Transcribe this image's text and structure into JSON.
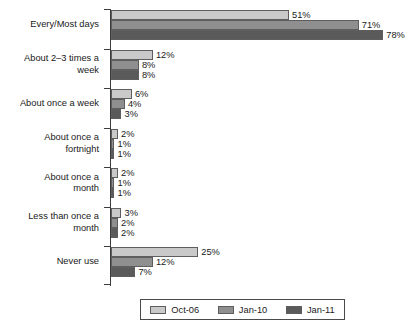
{
  "chart_data": {
    "type": "bar",
    "orientation": "horizontal",
    "title": "",
    "subtitle": "",
    "xlabel": "",
    "ylabel": "",
    "xlim": [
      0,
      80
    ],
    "grid": false,
    "legend_position": "bottom-center",
    "value_label_suffix": "%",
    "categories": [
      "Every/Most days",
      "About 2–3 times a\nweek",
      "About once a week",
      "About once a\nfortnight",
      "About once a\nmonth",
      "Less than once a\nmonth",
      "Never use"
    ],
    "series": [
      {
        "name": "Oct-06",
        "color": "#c9c9c9",
        "values": [
          51,
          12,
          6,
          2,
          2,
          3,
          25
        ],
        "labels": [
          "51%",
          "12%",
          "6%",
          "2%",
          "2%",
          "3%",
          "25%"
        ]
      },
      {
        "name": "Jan-10",
        "color": "#8f8f8f",
        "values": [
          71,
          8,
          4,
          1,
          1,
          2,
          12
        ],
        "labels": [
          "71%",
          "8%",
          "4%",
          "1%",
          "1%",
          "2%",
          "12%"
        ]
      },
      {
        "name": "Jan-11",
        "color": "#5a5a5a",
        "values": [
          78,
          8,
          3,
          1,
          1,
          2,
          7
        ],
        "labels": [
          "78%",
          "8%",
          "3%",
          "1%",
          "1%",
          "2%",
          "7%"
        ]
      }
    ]
  },
  "legend": {
    "items": [
      {
        "label": "Oct-06",
        "color": "#c9c9c9"
      },
      {
        "label": "Jan-10",
        "color": "#8f8f8f"
      },
      {
        "label": "Jan-11",
        "color": "#5a5a5a"
      }
    ]
  }
}
